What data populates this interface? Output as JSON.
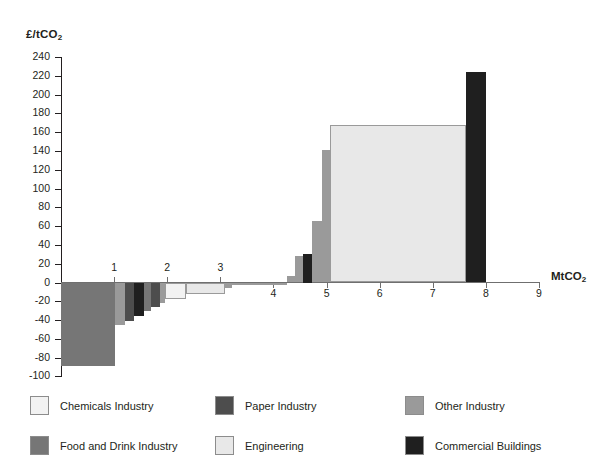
{
  "chart_data": {
    "type": "bar",
    "title": "",
    "ylabel": "£/tCO₂",
    "xlabel": "MtCO₂",
    "ylim": [
      -100,
      240
    ],
    "xlim": [
      0,
      9
    ],
    "yticks": [
      240,
      220,
      200,
      180,
      160,
      140,
      120,
      100,
      80,
      60,
      40,
      20,
      0,
      -20,
      -40,
      -60,
      -80,
      -100
    ],
    "xticks": [
      1,
      2,
      3,
      4,
      5,
      6,
      7,
      8,
      9
    ],
    "grid": false,
    "legend_position": "bottom",
    "note": "Marginal abatement cost curve: each bar spans an abatement width (MtCO2) at a cost (£/tCO2), ordered left to right by increasing cost.",
    "series": [
      {
        "name": "Food and Drink Industry",
        "color": "#767676"
      },
      {
        "name": "Chemicals Industry",
        "color": "#f2f2f2"
      },
      {
        "name": "Paper Industry",
        "color": "#4d4d4d"
      },
      {
        "name": "Engineering",
        "color": "#e8e8e8"
      },
      {
        "name": "Other Industry",
        "color": "#9a9a9a"
      },
      {
        "name": "Commercial Buildings",
        "color": "#1f1f1f"
      }
    ],
    "bars": [
      {
        "category": "Food and Drink Industry",
        "x_start": 0.0,
        "x_end": 1.02,
        "value": -89
      },
      {
        "category": "Other Industry",
        "x_start": 1.02,
        "x_end": 1.2,
        "value": -45
      },
      {
        "category": "Paper Industry",
        "x_start": 1.2,
        "x_end": 1.38,
        "value": -41
      },
      {
        "category": "Commercial Buildings",
        "x_start": 1.38,
        "x_end": 1.56,
        "value": -36
      },
      {
        "category": "Food and Drink Industry",
        "x_start": 1.56,
        "x_end": 1.7,
        "value": -30
      },
      {
        "category": "Paper Industry",
        "x_start": 1.7,
        "x_end": 1.86,
        "value": -26
      },
      {
        "category": "Other Industry",
        "x_start": 1.86,
        "x_end": 1.96,
        "value": -22
      },
      {
        "category": "Chemicals Industry",
        "x_start": 1.96,
        "x_end": 2.36,
        "value": -18
      },
      {
        "category": "Engineering",
        "x_start": 2.36,
        "x_end": 3.08,
        "value": -12
      },
      {
        "category": "Other Industry",
        "x_start": 3.08,
        "x_end": 3.22,
        "value": -6
      },
      {
        "category": "Chemicals Industry",
        "x_start": 3.22,
        "x_end": 4.26,
        "value": -2
      },
      {
        "category": "Other Industry",
        "x_start": 4.26,
        "x_end": 4.4,
        "value": 7
      },
      {
        "category": "Other Industry",
        "x_start": 4.4,
        "x_end": 4.56,
        "value": 28
      },
      {
        "category": "Commercial Buildings",
        "x_start": 4.56,
        "x_end": 4.72,
        "value": 30
      },
      {
        "category": "Other Industry",
        "x_start": 4.72,
        "x_end": 4.92,
        "value": 65
      },
      {
        "category": "Other Industry",
        "x_start": 4.92,
        "x_end": 5.06,
        "value": 141
      },
      {
        "category": "Engineering",
        "x_start": 5.06,
        "x_end": 7.62,
        "value": 168
      },
      {
        "category": "Commercial Buildings",
        "x_start": 7.62,
        "x_end": 8.0,
        "value": 224
      }
    ]
  },
  "legend": {
    "items": [
      {
        "label": "Chemicals Industry",
        "color": "#f2f2f2"
      },
      {
        "label": "Paper Industry",
        "color": "#4d4d4d"
      },
      {
        "label": "Other Industry",
        "color": "#9a9a9a"
      },
      {
        "label": "Food and Drink Industry",
        "color": "#767676"
      },
      {
        "label": "Engineering",
        "color": "#e8e8e8"
      },
      {
        "label": "Commercial Buildings",
        "color": "#1f1f1f"
      }
    ]
  }
}
